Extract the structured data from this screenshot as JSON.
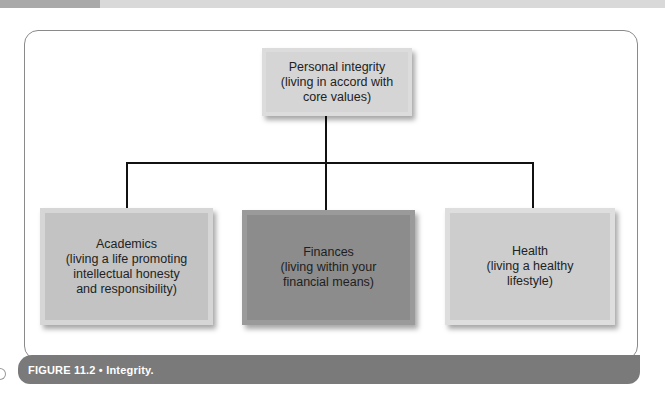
{
  "figure": {
    "caption_label": "FIGURE 11.2",
    "caption_separator": "•",
    "caption_title": "Integrity.",
    "caption_full": "FIGURE 11.2 • Integrity."
  },
  "diagram": {
    "root": {
      "title": "Personal integrity",
      "lines": [
        "(living in accord with",
        "core values)"
      ]
    },
    "children": [
      {
        "title": "Academics",
        "lines": [
          "(living a life promoting",
          "intellectual honesty",
          "and responsibility)"
        ],
        "fill": "#c3c3c3"
      },
      {
        "title": "Finances",
        "lines": [
          "(living within your",
          "financial means)"
        ],
        "fill": "#8c8c8c"
      },
      {
        "title": "Health",
        "lines": [
          "(living a healthy",
          "lifestyle)"
        ],
        "fill": "#cdcdcd"
      }
    ]
  },
  "colors": {
    "caption_bar": "#7a7a7a",
    "frame_border": "#8a8a8a",
    "connector": "#111111"
  }
}
